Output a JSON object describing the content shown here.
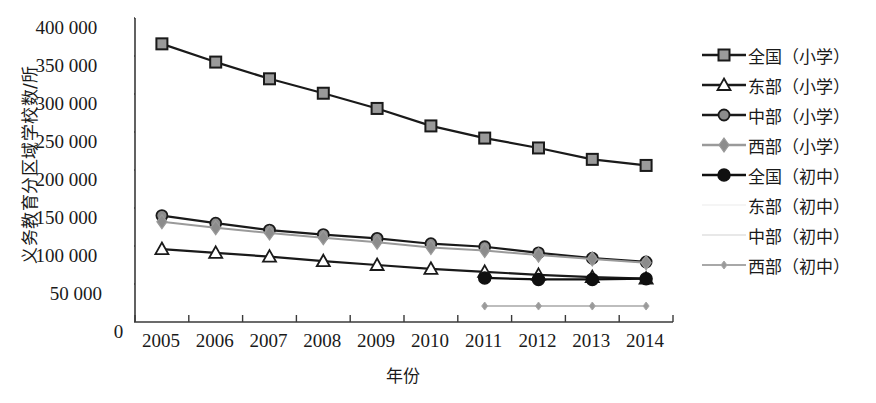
{
  "chart_data": {
    "type": "line",
    "title": "",
    "xlabel": "年份",
    "ylabel": "义务教育分区域学校数/所",
    "categories": [
      "2005",
      "2006",
      "2007",
      "2008",
      "2009",
      "2010",
      "2011",
      "2012",
      "2013",
      "2014"
    ],
    "ylim": [
      0,
      400000
    ],
    "ytick_labels": [
      "0",
      "50 000",
      "100 000",
      "150 000",
      "200 000",
      "250 000",
      "300 000",
      "350 000",
      "400 000"
    ],
    "ytick_values": [
      0,
      50000,
      100000,
      150000,
      200000,
      250000,
      300000,
      350000,
      400000
    ],
    "grid": false,
    "legend_position": "right",
    "series": [
      {
        "name": "全国（小学）",
        "marker": "square",
        "color": "#1a1a1a",
        "marker_fill": "#9a9a9a",
        "x": [
          "2005",
          "2006",
          "2007",
          "2008",
          "2009",
          "2010",
          "2011",
          "2012",
          "2013",
          "2014"
        ],
        "values": [
          366000,
          342000,
          320000,
          301000,
          281000,
          258000,
          242000,
          229000,
          214000,
          206000
        ]
      },
      {
        "name": "东部（小学）",
        "marker": "triangle",
        "color": "#1a1a1a",
        "marker_fill": "#ffffff",
        "x": [
          "2005",
          "2006",
          "2007",
          "2008",
          "2009",
          "2010",
          "2011",
          "2012",
          "2013",
          "2014"
        ],
        "values": [
          96000,
          91000,
          86000,
          80000,
          75000,
          70000,
          66000,
          62000,
          59000,
          57000
        ]
      },
      {
        "name": "中部（小学）",
        "marker": "circle",
        "color": "#1a1a1a",
        "marker_fill": "#8c8c8c",
        "x": [
          "2005",
          "2006",
          "2007",
          "2008",
          "2009",
          "2010",
          "2011",
          "2012",
          "2013",
          "2014"
        ],
        "values": [
          140000,
          130000,
          121000,
          115000,
          110000,
          103000,
          99000,
          91000,
          84000,
          79000
        ]
      },
      {
        "name": "西部（小学）",
        "marker": "diamond",
        "color": "#9a9a9a",
        "marker_fill": "#8c8c8c",
        "x": [
          "2005",
          "2006",
          "2007",
          "2008",
          "2009",
          "2010",
          "2011",
          "2012",
          "2013",
          "2014"
        ],
        "values": [
          132000,
          124000,
          117000,
          111000,
          105000,
          98000,
          94000,
          88000,
          83000,
          78000
        ]
      },
      {
        "name": "全国（初中）",
        "marker": "filled-circle",
        "color": "#101010",
        "marker_fill": "#101010",
        "x": [
          "2011",
          "2012",
          "2013",
          "2014"
        ],
        "values": [
          58000,
          56000,
          56000,
          57000
        ]
      },
      {
        "name": "东部（初中）",
        "marker": "none",
        "color": "#f2f2f2",
        "marker_fill": "#f2f2f2",
        "x": [],
        "values": []
      },
      {
        "name": "中部（初中）",
        "marker": "none",
        "color": "#e0e0e0",
        "marker_fill": "#e0e0e0",
        "x": [],
        "values": []
      },
      {
        "name": "西部（初中）",
        "marker": "small-diamond",
        "color": "#a8a8a8",
        "marker_fill": "#9a9a9a",
        "x": [
          "2011",
          "2012",
          "2013",
          "2014"
        ],
        "values": [
          21000,
          21000,
          21000,
          21000
        ]
      }
    ]
  }
}
